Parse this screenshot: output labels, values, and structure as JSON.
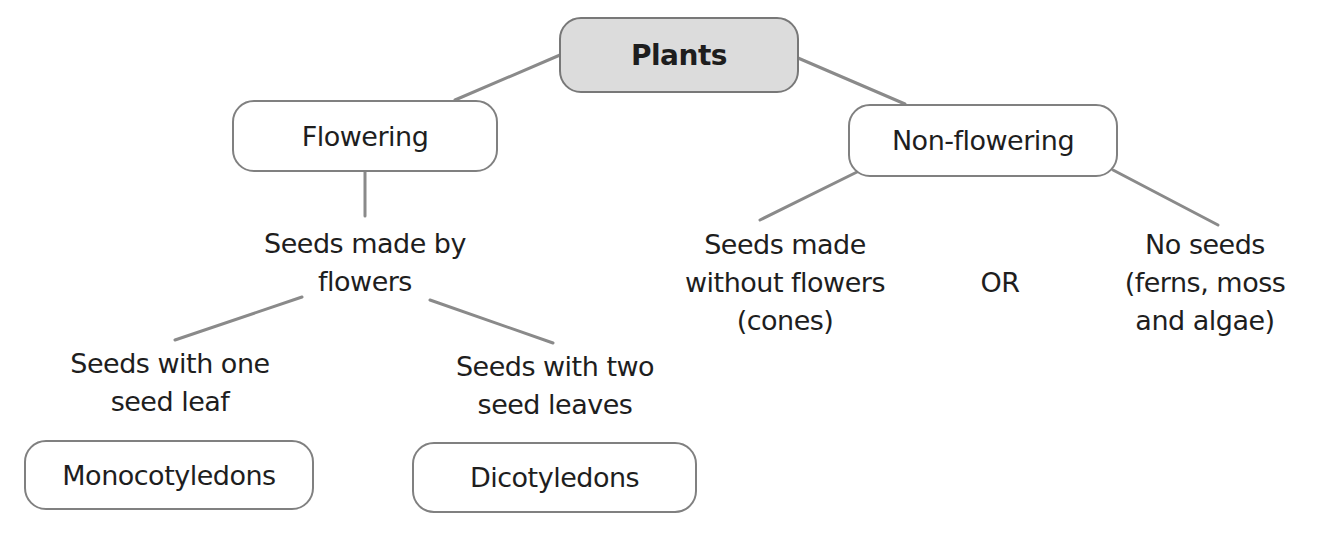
{
  "diagram": {
    "root": "Plants",
    "flowering": {
      "label": "Flowering",
      "description": [
        "Seeds made by",
        "flowers"
      ],
      "children": [
        {
          "description": [
            "Seeds with one",
            "seed leaf"
          ],
          "box": "Monocotyledons"
        },
        {
          "description": [
            "Seeds with two",
            "seed leaves"
          ],
          "box": "Dicotyledons"
        }
      ]
    },
    "non_flowering": {
      "label": "Non-flowering",
      "children": [
        {
          "description": [
            "Seeds made",
            "without flowers",
            "(cones)"
          ]
        },
        {
          "description": [
            "No seeds",
            "(ferns, moss",
            "and algae)"
          ]
        }
      ],
      "connector": "OR"
    }
  },
  "colors": {
    "root_fill": "#dcdcdc",
    "border": "#808080",
    "line": "#8a8a8a",
    "text": "#1e1e1e"
  }
}
